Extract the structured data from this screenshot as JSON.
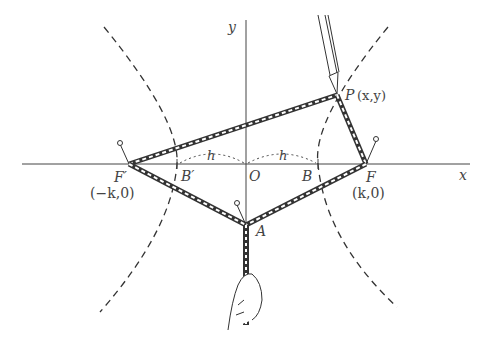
{
  "diagram": {
    "type": "hyperbola-string-construction",
    "axes": {
      "x_label": "x",
      "y_label": "y",
      "origin_label": "O"
    },
    "points": {
      "F_prime": {
        "label": "F′",
        "coords": "(−k,0)"
      },
      "F": {
        "label": "F",
        "coords": "(k,0)"
      },
      "B_prime": {
        "label": "B′"
      },
      "B": {
        "label": "B"
      },
      "P": {
        "label": "P",
        "coords": "(x,y)"
      },
      "A": {
        "label": "A"
      }
    },
    "distance_label_left": "h",
    "distance_label_right": "h",
    "colors": {
      "ink": "#333333",
      "background": "#ffffff"
    }
  }
}
